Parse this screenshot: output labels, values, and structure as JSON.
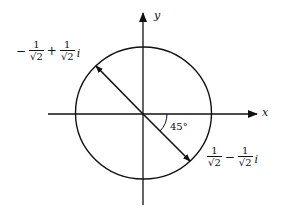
{
  "figure": {
    "type": "complex-plane-unit-circle",
    "axes": {
      "x_label": "x",
      "y_label": "y"
    },
    "angle_label": "45°",
    "points": {
      "upper_left": {
        "sign1": "−",
        "num1": "1",
        "den1_root": "√",
        "den1_rad": "2",
        "op": "+",
        "num2": "1",
        "den2_root": "√",
        "den2_rad": "2",
        "imag": "i"
      },
      "lower_right": {
        "num1": "1",
        "den1_root": "√",
        "den1_rad": "2",
        "op": "−",
        "num2": "1",
        "den2_root": "√",
        "den2_rad": "2",
        "imag": "i"
      }
    },
    "colors": {
      "stroke": "#111111",
      "background": "#ffffff"
    }
  }
}
